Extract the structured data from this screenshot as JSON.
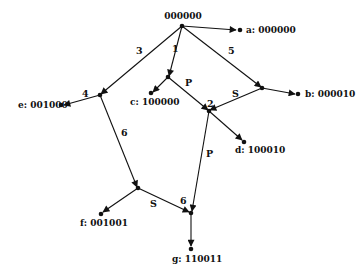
{
  "root": {
    "label": "000000"
  },
  "edge_labels": {
    "e1": "1",
    "e3": "3",
    "e5": "5",
    "e4": "4",
    "p1": "P",
    "s2": "S",
    "e2": "2",
    "e6a": "6",
    "p2": "P",
    "s6": "S",
    "e6b": "6"
  },
  "leaves": {
    "a": "a: 000000",
    "b": "b: 000010",
    "c": "c: 100000",
    "d": "d: 100010",
    "e": "e: 001000",
    "f": "f: 001001",
    "g": "g: 110011"
  }
}
